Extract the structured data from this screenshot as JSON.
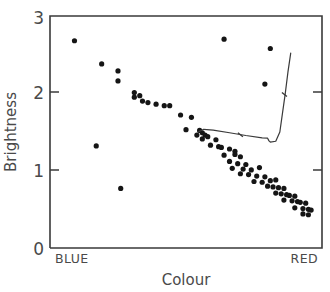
{
  "chart_data": {
    "type": "scatter",
    "title": "",
    "xlabel": "Colour",
    "ylabel": "Brightness",
    "grid": false,
    "legend": null,
    "x_axis": {
      "label": "Colour",
      "tick_labels": [
        "BLUE",
        "RED"
      ],
      "left_label": "BLUE",
      "right_label": "RED",
      "xlim": [
        0,
        1
      ],
      "ticks": []
    },
    "y_axis": {
      "label": "Brightness",
      "tick_labels": [
        "0",
        "1",
        "2",
        "3"
      ],
      "ylim": [
        0,
        3
      ],
      "ticks": [
        0,
        1,
        2,
        3
      ]
    },
    "series": [
      {
        "name": "observed-stars",
        "marker": "filled-circle",
        "color": "#151515",
        "points": [
          [
            0.09,
            2.68
          ],
          [
            0.19,
            2.38
          ],
          [
            0.25,
            2.29
          ],
          [
            0.25,
            2.16
          ],
          [
            0.17,
            1.32
          ],
          [
            0.26,
            0.77
          ],
          [
            0.31,
            2.01
          ],
          [
            0.31,
            1.95
          ],
          [
            0.33,
            1.97
          ],
          [
            0.34,
            1.9
          ],
          [
            0.36,
            1.88
          ],
          [
            0.39,
            1.86
          ],
          [
            0.42,
            1.84
          ],
          [
            0.44,
            1.84
          ],
          [
            0.48,
            1.72
          ],
          [
            0.52,
            1.69
          ],
          [
            0.5,
            1.53
          ],
          [
            0.55,
            1.52
          ],
          [
            0.56,
            1.49
          ],
          [
            0.54,
            1.46
          ],
          [
            0.57,
            1.46
          ],
          [
            0.58,
            1.44
          ],
          [
            0.56,
            1.41
          ],
          [
            0.61,
            1.4
          ],
          [
            0.59,
            1.33
          ],
          [
            0.62,
            1.31
          ],
          [
            0.63,
            1.3
          ],
          [
            0.66,
            1.28
          ],
          [
            0.68,
            1.25
          ],
          [
            0.64,
            1.2
          ],
          [
            0.68,
            1.21
          ],
          [
            0.7,
            1.18
          ],
          [
            0.66,
            1.12
          ],
          [
            0.69,
            1.09
          ],
          [
            0.72,
            1.08
          ],
          [
            0.67,
            1.03
          ],
          [
            0.71,
            1.02
          ],
          [
            0.74,
            1.01
          ],
          [
            0.77,
            1.04
          ],
          [
            0.7,
            0.96
          ],
          [
            0.73,
            0.95
          ],
          [
            0.76,
            0.93
          ],
          [
            0.79,
            0.92
          ],
          [
            0.75,
            0.86
          ],
          [
            0.78,
            0.85
          ],
          [
            0.81,
            0.87
          ],
          [
            0.83,
            0.88
          ],
          [
            0.8,
            0.8
          ],
          [
            0.82,
            0.79
          ],
          [
            0.84,
            0.78
          ],
          [
            0.86,
            0.77
          ],
          [
            0.83,
            0.71
          ],
          [
            0.85,
            0.7
          ],
          [
            0.87,
            0.69
          ],
          [
            0.88,
            0.68
          ],
          [
            0.9,
            0.67
          ],
          [
            0.86,
            0.62
          ],
          [
            0.89,
            0.61
          ],
          [
            0.91,
            0.6
          ],
          [
            0.92,
            0.59
          ],
          [
            0.94,
            0.58
          ],
          [
            0.9,
            0.52
          ],
          [
            0.93,
            0.51
          ],
          [
            0.95,
            0.5
          ],
          [
            0.96,
            0.49
          ],
          [
            0.93,
            0.44
          ],
          [
            0.95,
            0.43
          ],
          [
            0.64,
            2.7
          ],
          [
            0.81,
            2.58
          ],
          [
            0.79,
            2.12
          ]
        ]
      }
    ],
    "annotations": [
      {
        "name": "theoretical-isochrone",
        "type": "line",
        "points": [
          [
            0.545,
            1.5
          ],
          [
            0.565,
            1.535
          ],
          [
            0.6,
            1.525
          ],
          [
            0.66,
            1.49
          ],
          [
            0.72,
            1.455
          ],
          [
            0.78,
            1.425
          ],
          [
            0.8,
            1.42
          ],
          [
            0.805,
            1.385
          ],
          [
            0.81,
            1.37
          ],
          [
            0.83,
            1.38
          ],
          [
            0.845,
            1.5
          ],
          [
            0.855,
            1.75
          ],
          [
            0.865,
            2.0
          ],
          [
            0.875,
            2.28
          ],
          [
            0.885,
            2.52
          ]
        ],
        "tick_marks": [
          {
            "x": 0.7,
            "y": 1.465
          },
          {
            "x": 0.862,
            "y": 1.985
          }
        ]
      }
    ]
  },
  "figure": {
    "axis_color": "#3a3a3a",
    "marker_color": "#151515",
    "background": "#ffffff"
  }
}
